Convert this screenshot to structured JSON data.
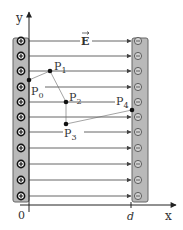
{
  "diagram": {
    "axes": {
      "y_label": "y",
      "x_label": "x",
      "origin_label": "0",
      "d_label": "d"
    },
    "field_label": "E⃗",
    "field_label_text": "E",
    "positive_plate": {
      "charge_symbol": "+",
      "count": 11,
      "color": "#b9b9b9"
    },
    "negative_plate": {
      "charge_symbol": "−",
      "count": 11,
      "color": "#b9b9b9"
    },
    "field_lines_count": 11,
    "points": [
      {
        "label": "P",
        "sub": "0",
        "name": "P0"
      },
      {
        "label": "P",
        "sub": "1",
        "name": "P1"
      },
      {
        "label": "P",
        "sub": "2",
        "name": "P2"
      },
      {
        "label": "P",
        "sub": "3",
        "name": "P3"
      },
      {
        "label": "P",
        "sub": "4",
        "name": "P4"
      }
    ],
    "path": "P0 → P1 → P2 → P3 → P4"
  }
}
